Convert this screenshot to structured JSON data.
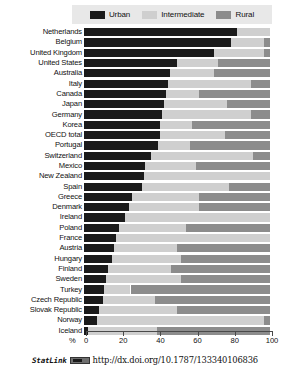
{
  "chart_data": {
    "type": "bar",
    "orientation": "horizontal",
    "stacked": true,
    "title": "",
    "xlabel": "%",
    "ylabel": "",
    "xlim": [
      0,
      100
    ],
    "xticks": [
      0,
      20,
      40,
      60,
      80,
      100
    ],
    "grid": false,
    "legend_position": "top",
    "legend": [
      "Urban",
      "Intermediate",
      "Rural"
    ],
    "colors": {
      "urban": "#1b1b1b",
      "intermediate": "#cfcfcf",
      "rural": "#8c8c8c",
      "legend_background": "#e8e8e8",
      "axis": "#4a4a4a"
    },
    "categories": [
      "Netherlands",
      "Belgium",
      "United Kingdom",
      "United States",
      "Australia",
      "Italy",
      "Canada",
      "Japan",
      "Germany",
      "Korea",
      "OECD total",
      "Portugal",
      "Switzerland",
      "Mexico",
      "New Zealand",
      "Spain",
      "Greece",
      "Denmark",
      "Ireland",
      "Poland",
      "France",
      "Austria",
      "Hungary",
      "Finland",
      "Sweden",
      "Turkey",
      "Czech Republic",
      "Slovak Republic",
      "Norway",
      "Iceland"
    ],
    "series": [
      {
        "name": "Urban",
        "values": [
          82,
          79,
          70,
          50,
          46,
          45,
          44,
          43,
          42,
          41,
          41,
          40,
          36,
          33,
          32,
          31,
          26,
          24,
          22,
          19,
          17,
          16,
          15,
          13,
          12,
          11,
          10,
          8,
          7,
          2
        ]
      },
      {
        "name": "Intermediate",
        "values": [
          18,
          18,
          27,
          22,
          24,
          45,
          18,
          34,
          48,
          17,
          35,
          17,
          55,
          27,
          68,
          47,
          36,
          38,
          78,
          36,
          83,
          34,
          37,
          34,
          40,
          14,
          28,
          42,
          90,
          37
        ]
      },
      {
        "name": "Rural",
        "values": [
          0,
          3,
          3,
          28,
          30,
          10,
          38,
          23,
          10,
          42,
          24,
          43,
          9,
          40,
          0,
          22,
          38,
          38,
          0,
          45,
          0,
          50,
          48,
          53,
          48,
          75,
          62,
          50,
          3,
          61
        ]
      }
    ]
  },
  "axis": {
    "unit_label": "%",
    "tick_labels": [
      "0",
      "20",
      "40",
      "60",
      "80",
      "100"
    ]
  },
  "footer": {
    "statlink_label": "StatLink",
    "statlink_badge": "statlink-logo-icon",
    "doi_url": "http://dx.doi.org/10.1787/133340106836"
  }
}
